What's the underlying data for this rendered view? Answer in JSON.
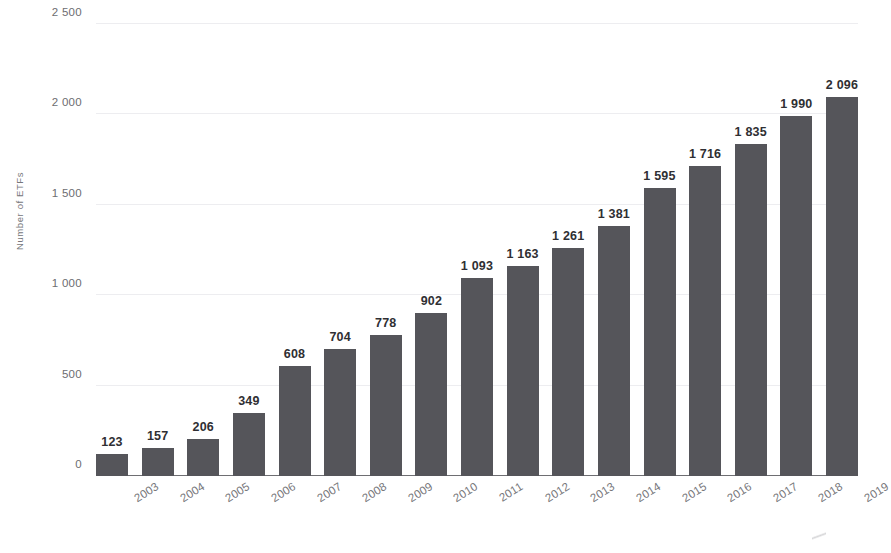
{
  "chart_data": {
    "type": "bar",
    "title": "",
    "subtitle": "",
    "xlabel": "",
    "ylabel": "Number of ETFs",
    "categories": [
      "2003",
      "2004",
      "2005",
      "2006",
      "2007",
      "2008",
      "2009",
      "2010",
      "2011",
      "2012",
      "2013",
      "2014",
      "2015",
      "2016",
      "2017",
      "2018",
      "2019"
    ],
    "values": [
      123,
      157,
      206,
      349,
      608,
      704,
      778,
      902,
      1093,
      1163,
      1261,
      1381,
      1595,
      1716,
      1835,
      1990,
      2096
    ],
    "value_labels": [
      "123",
      "157",
      "206",
      "349",
      "608",
      "704",
      "778",
      "902",
      "1 093",
      "1 163",
      "1 261",
      "1 381",
      "1 595",
      "1 716",
      "1 835",
      "1 990",
      "2 096"
    ],
    "ylim": [
      0,
      2500
    ],
    "yticks": [
      0,
      500,
      1000,
      1500,
      2000,
      2500
    ],
    "ytick_labels": [
      "0",
      "500",
      "1 000",
      "1 500",
      "2 000",
      "2 500"
    ],
    "grid": true,
    "legend": "none",
    "series_name": "Number of ETFs",
    "bar_color": "#55555a",
    "gridline_color": "#ededf0",
    "axis_color": "#6e6e72",
    "label_color": "#2f2f33",
    "tick_color": "#76767a",
    "background": "#ffffff"
  }
}
